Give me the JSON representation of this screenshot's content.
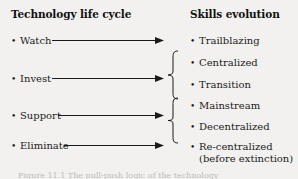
{
  "figure": {
    "background_color": "#f2f1ef",
    "text_color": "#1a1a1a",
    "columns": {
      "left_heading": "Technology life cycle",
      "right_heading": "Skills evolution"
    },
    "left_items": [
      {
        "label": "Watch"
      },
      {
        "label": "Invest"
      },
      {
        "label": "Support"
      },
      {
        "label": "Eliminate"
      }
    ],
    "right_items": [
      {
        "label": "Trailblazing"
      },
      {
        "label": "Centralized"
      },
      {
        "label": "Transition"
      },
      {
        "label": "Mainstream"
      },
      {
        "label": "Decentralized"
      },
      {
        "label": "Re-centralized",
        "sub": "(before extinction)"
      }
    ],
    "bullet_glyph": "•",
    "caption": "Figure 11.1   The pull-push logic of the technology"
  }
}
